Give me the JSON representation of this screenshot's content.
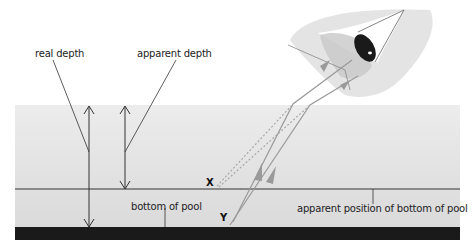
{
  "labels": {
    "real_depth": "real depth",
    "apparent_depth": "apparent depth",
    "bottom_of_pool": "bottom of pool",
    "apparent_position": "apparent position of bottom of pool",
    "point_x": "X",
    "point_y": "Y"
  },
  "colors": {
    "water_top": "#e9e9e9",
    "water_bottom": "#dcdcdc",
    "pool_bottom": "#1a1a1a",
    "ray": "#9a9a9a",
    "line": "#333333",
    "eye_skin": "#e6e6e6",
    "iris": "#1a1a1a"
  }
}
